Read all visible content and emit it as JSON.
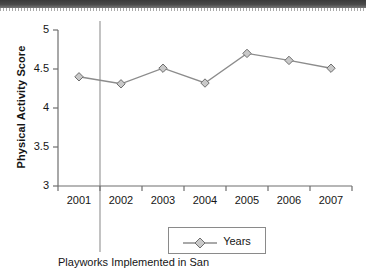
{
  "figure": {
    "y_axis_title": "Physical Activity Score",
    "caption": "Playworks Implemented in San",
    "legend": {
      "label": "Years",
      "marker": "diamond-marker-icon"
    },
    "reference_line": {
      "name": "playworks-implementation-line",
      "position_between": "2001-2002"
    },
    "colors": {
      "series_line": "#8c8c8c",
      "marker_fill": "#c9c9c9",
      "marker_stroke": "#6e6e6e",
      "axis": "#6e6e6e",
      "text": "#161616",
      "header_band": "#434343"
    }
  },
  "chart_data": {
    "type": "line",
    "title": "",
    "subtitle": "",
    "xlabel": "",
    "ylabel": "Physical Activity Score",
    "categories": [
      "2001",
      "2002",
      "2003",
      "2004",
      "2005",
      "2006",
      "2007"
    ],
    "series": [
      {
        "name": "Years",
        "values": [
          4.4,
          4.31,
          4.51,
          4.32,
          4.7,
          4.61,
          4.51
        ]
      }
    ],
    "ylim": [
      3,
      5
    ],
    "yticks": [
      "3",
      "3.5",
      "4",
      "4.5",
      "5"
    ],
    "ytick_values": [
      3,
      3.5,
      4,
      4.5,
      5
    ],
    "xticks": [
      "2001",
      "2002",
      "2003",
      "2004",
      "2005",
      "2006",
      "2007"
    ],
    "grid": false,
    "legend_position": "bottom",
    "annotations": [
      {
        "type": "vline",
        "label": "Playworks Implemented in San",
        "x_between": [
          "2001",
          "2002"
        ]
      }
    ]
  }
}
